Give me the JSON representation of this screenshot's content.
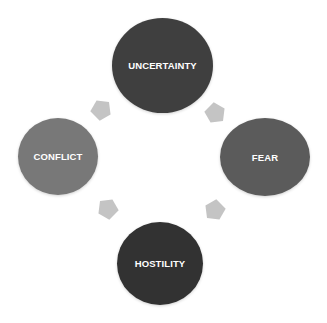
{
  "diagram": {
    "type": "cycle",
    "nodes": [
      {
        "id": "uncertainty",
        "label": "UNCERTAINTY",
        "color": "#3f3f3f"
      },
      {
        "id": "fear",
        "label": "FEAR",
        "color": "#5b5b5b"
      },
      {
        "id": "hostility",
        "label": "HOSTILITY",
        "color": "#323232"
      },
      {
        "id": "conflict",
        "label": "CONFLICT",
        "color": "#787878"
      }
    ],
    "edges": [
      {
        "from": "uncertainty",
        "to": "fear"
      },
      {
        "from": "fear",
        "to": "hostility"
      },
      {
        "from": "hostility",
        "to": "conflict"
      },
      {
        "from": "conflict",
        "to": "uncertainty"
      }
    ],
    "arrow_color": "#c4c4c4"
  }
}
